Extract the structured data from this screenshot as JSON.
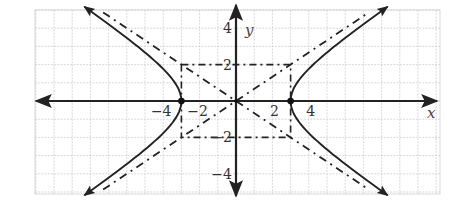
{
  "figure": {
    "equation": "x^2/9 - y^2/4 = 1",
    "a": 3,
    "b": 2,
    "vertices": [
      [
        -3,
        0
      ],
      [
        3,
        0
      ]
    ],
    "asymptotes": [
      "y = (2/3)x",
      "y = -(2/3)x"
    ],
    "central_rectangle": {
      "x_min": -3,
      "x_max": 3,
      "y_min": -2,
      "y_max": 2
    },
    "axes": {
      "x_label": "x",
      "y_label": "y",
      "x_ticks": [
        {
          "value": -4,
          "label": "−4"
        },
        {
          "value": -2,
          "label": "−2"
        },
        {
          "value": 2,
          "label": "2"
        },
        {
          "value": 4,
          "label": "4"
        }
      ],
      "y_ticks": [
        {
          "value": 4,
          "label": "4"
        },
        {
          "value": 2,
          "label": "2"
        },
        {
          "value": -2,
          "label": "−2"
        },
        {
          "value": -4,
          "label": "−4"
        }
      ],
      "x_range": [
        -11,
        11
      ],
      "y_range": [
        -4.5,
        5
      ]
    },
    "grid": true,
    "colors": {
      "curve": "#222222",
      "grid": "#cccccc",
      "axis": "#222222",
      "dashed": "#222222"
    }
  }
}
